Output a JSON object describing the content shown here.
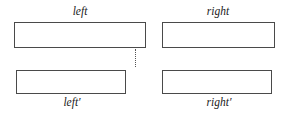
{
  "figure": {
    "type": "two-row-block-diagram",
    "background_color": "#ffffff",
    "stroke_color": "#4a4a4a",
    "text_color": "#1a1a1a"
  },
  "labels": {
    "top_left": "left",
    "top_right": "right",
    "bottom_left": "left′",
    "bottom_right": "right′"
  },
  "boxes": [
    {
      "name": "left-top",
      "label_ref": "top_left",
      "label_position": "above",
      "has_divider": true,
      "divider_style": "dotted-vertical"
    },
    {
      "name": "right-top",
      "label_ref": "top_right",
      "label_position": "above",
      "has_divider": false,
      "divider_style": ""
    },
    {
      "name": "left-bottom",
      "label_ref": "bottom_left",
      "label_position": "below",
      "has_divider": false,
      "divider_style": ""
    },
    {
      "name": "right-bottom",
      "label_ref": "bottom_right",
      "label_position": "below",
      "has_divider": false,
      "divider_style": ""
    }
  ]
}
